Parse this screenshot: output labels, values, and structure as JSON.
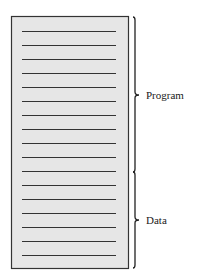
{
  "diagram": {
    "type": "memory-layout",
    "box": {
      "x": 11,
      "y": 16,
      "width": 117,
      "height": 252,
      "fill": "#e6e6e6",
      "stroke": "#333333"
    },
    "line_color": "#333333",
    "line_x1": 22,
    "line_x2": 116,
    "line_ys": [
      31,
      45,
      59,
      73,
      87,
      101,
      115,
      129,
      143,
      157,
      171,
      185,
      199,
      213,
      227,
      241,
      255
    ],
    "segments": [
      {
        "label": "Program",
        "y_start": 17,
        "y_end": 172,
        "tip_y": 95
      },
      {
        "label": "Data",
        "y_start": 172,
        "y_end": 268,
        "tip_y": 220
      }
    ]
  },
  "labels": {
    "program": "Program",
    "data": "Data"
  }
}
